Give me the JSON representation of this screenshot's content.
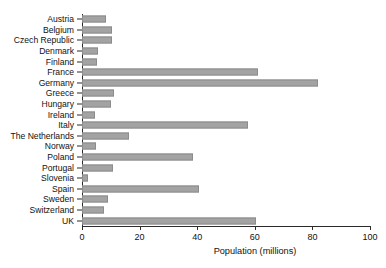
{
  "chart_data": {
    "type": "bar",
    "orientation": "horizontal",
    "title": "",
    "subtitle": "",
    "xlabel": "Population (millions)",
    "ylabel": "",
    "xlim": [
      0,
      100
    ],
    "xticks": [
      0,
      20,
      40,
      60,
      80,
      100
    ],
    "xtick_labels": [
      "0",
      "20",
      "40",
      "60",
      "80",
      "100"
    ],
    "grid": false,
    "legend": null,
    "bar_color": "#a3a3a3",
    "bar_edge_color": "#8c8c8c",
    "axis_color": "#2b2b2b",
    "categories": [
      "Austria",
      "Belgium",
      "Czech Republic",
      "Denmark",
      "Finland",
      "France",
      "Germany",
      "Greece",
      "Hungary",
      "Ireland",
      "Italy",
      "The Netherlands",
      "Norway",
      "Poland",
      "Portugal",
      "Slovenia",
      "Spain",
      "Sweden",
      "Switzerland",
      "UK"
    ],
    "values": [
      8.3,
      10.4,
      10.3,
      5.5,
      5.3,
      61.0,
      82.0,
      11.2,
      10.0,
      4.4,
      57.5,
      16.4,
      4.7,
      38.5,
      10.6,
      2.0,
      40.5,
      9.0,
      7.5,
      60.5
    ],
    "series": [
      {
        "name": "Population (millions)",
        "values": [
          8.3,
          10.4,
          10.3,
          5.5,
          5.3,
          61.0,
          82.0,
          11.2,
          10.0,
          4.4,
          57.5,
          16.4,
          4.7,
          38.5,
          10.6,
          2.0,
          40.5,
          9.0,
          7.5,
          60.5
        ]
      }
    ]
  }
}
